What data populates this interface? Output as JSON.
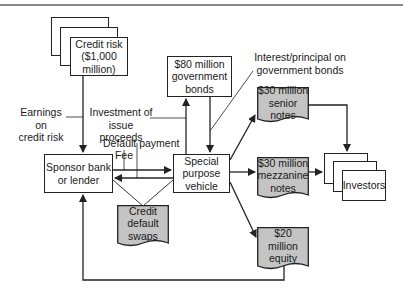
{
  "diagram": {
    "nodes": {
      "credit_risk": "Credit risk\n($1,000\nmillion)",
      "gov_bonds": "$80 million\ngovernment\nbonds",
      "sponsor": "Sponsor bank\nor lender",
      "spv": "Special\npurpose\nvehicle",
      "cds": "Credit\ndefault\nswaps",
      "senior": "$30 million\nsenior notes",
      "mezzanine": "$30 million\nmezzanine\nnotes",
      "equity": "$20\nmillion\nequity",
      "investors": "Investors"
    },
    "labels": {
      "earnings": "Earnings on\ncredit risk",
      "investment": "Investment of issue\nproceeds",
      "default_payment": "Default payment",
      "fee": "Fee",
      "interest": "Interest/principal on\ngovernment bonds"
    },
    "colors": {
      "line": "#222222",
      "doc_fill": "#c4c4c4",
      "box_fill": "#ffffff",
      "rule": "#8a8a8a"
    }
  }
}
